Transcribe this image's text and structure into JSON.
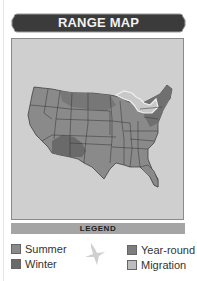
{
  "header": {
    "title": "RANGE MAP"
  },
  "map": {
    "region": "United States",
    "colors": {
      "background": "#cfcfcf",
      "summer": "#8a8a8a",
      "winter": "#6f6f6f",
      "year_round": "#7f7f7f",
      "migration": "#b4b4b4",
      "great_lakes_outline": "#efefef",
      "state_borders": "#333333"
    }
  },
  "legend": {
    "title": "LEGEND",
    "items": [
      {
        "label": "Summer",
        "color": "#8a8a8a"
      },
      {
        "label": "Winter",
        "color": "#6a6a6a"
      },
      {
        "label": "Year-round",
        "color": "#7d7d7d"
      },
      {
        "label": "Migration",
        "color": "#bdbdbd"
      }
    ]
  }
}
